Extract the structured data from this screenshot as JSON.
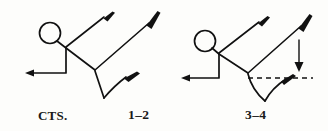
{
  "diagram": {
    "background_color": "#fdfdfb",
    "ink_color": "#111111",
    "labels": {
      "counts_label": "CTS.",
      "beat_1_2": "1–2",
      "beat_3_4": "3–4"
    },
    "figures": [
      {
        "name": "figure-1-2",
        "label": "1–2",
        "head": {
          "cx": 50,
          "cy": 33,
          "r": 10.5
        },
        "parts": [
          "torso",
          "left-arm-bent-down-back",
          "right-arm-raised-up-right",
          "hip-joint",
          "right-leg-extended-up-right",
          "left-leg-bent-v-down"
        ],
        "limb_tips": [
          "arm-tip-up-right",
          "leg-tip-up-right",
          "foot-tip-right"
        ]
      },
      {
        "name": "figure-3-4",
        "label": "3–4",
        "head": {
          "cx": 205,
          "cy": 41,
          "r": 10.5
        },
        "parts": [
          "torso",
          "left-arm-bent-down-back",
          "right-arm-raised-up-right",
          "hip-joint",
          "right-leg-extended-up-right",
          "left-leg-curved-swing"
        ],
        "limb_tips": [
          "arm-tip-up-right",
          "leg-tip-up-right",
          "foot-tip-right"
        ],
        "annotations": {
          "dashed_reference_line": {
            "name": "horizontal-dashed-line",
            "y": 78,
            "x1": 248,
            "x2": 313
          },
          "direction_arrow": {
            "name": "downward-arrow",
            "x": 299,
            "y1": 40,
            "y2": 71,
            "direction": "down"
          }
        }
      }
    ]
  }
}
